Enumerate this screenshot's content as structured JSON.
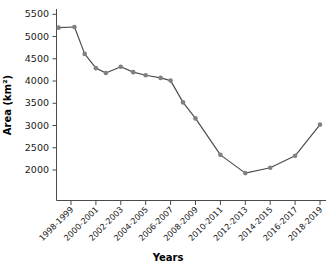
{
  "chart_data": {
    "type": "line",
    "title": "",
    "xlabel": "Years",
    "ylabel": "Area (km²)",
    "ylim": [
      1700,
      5500
    ],
    "yticks": [
      2000,
      2500,
      3000,
      3500,
      4000,
      4500,
      5000,
      5500
    ],
    "ytick_labels": [
      "2000",
      "2500",
      "3000",
      "3500",
      "4000",
      "4500",
      "5000",
      "5500"
    ],
    "grid": false,
    "legend": "none",
    "categories": [
      "1998-1999",
      "1999-2000",
      "2000-2001",
      "2001-2002",
      "2002-2003",
      "2003-2004",
      "2004-2005",
      "2005-2006",
      "2006-2007",
      "2007-2008",
      "2008-2009",
      "2009-2010",
      "2010-2011",
      "2011-2012",
      "2012-2013",
      "2013-2014",
      "2014-2015",
      "2015-2016",
      "2016-2017",
      "2017-2018",
      "2018-2019"
    ],
    "xtick_labels": [
      "1998-1999",
      "2000-2001",
      "2002-2003",
      "2004-2005",
      "2006-2007",
      "2008-2009",
      "2010-2011",
      "2012-2013",
      "2014-2015",
      "2016-2017",
      "2018-2019"
    ],
    "series": [
      {
        "name": "Area",
        "color": "#808080",
        "line_color": "#4d4d4d",
        "x": [
          -0.5,
          0.14,
          0.55,
          1.0,
          1.4,
          2.0,
          2.5,
          3.0,
          3.6,
          4.0,
          4.5,
          5.0,
          6.0,
          7.0,
          8.0,
          9.0,
          10.0
        ],
        "values": [
          5200,
          5215,
          4610,
          4290,
          4180,
          4320,
          4200,
          4130,
          4070,
          4010,
          3520,
          3160,
          2340,
          1930,
          2050,
          2320,
          3020
        ]
      }
    ]
  },
  "figure": {
    "background": "#ffffff",
    "axis_color": "#4a4a4a"
  }
}
